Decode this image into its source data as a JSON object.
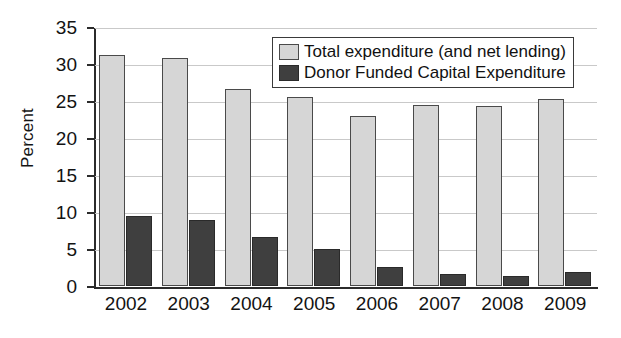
{
  "chart_data": {
    "type": "bar",
    "title": "",
    "xlabel": "",
    "ylabel": "Percent",
    "categories": [
      "2002",
      "2003",
      "2004",
      "2005",
      "2006",
      "2007",
      "2008",
      "2009"
    ],
    "series": [
      {
        "name": "Total expenditure (and net lending)",
        "color": "#d6d6d6",
        "values": [
          31.2,
          30.8,
          26.6,
          25.5,
          23.0,
          24.5,
          24.3,
          25.3
        ]
      },
      {
        "name": "Donor Funded Capital Expenditure",
        "color": "#3f3f3f",
        "values": [
          9.4,
          8.9,
          6.6,
          5.0,
          2.6,
          1.6,
          1.3,
          1.9
        ]
      }
    ],
    "ylim": [
      0,
      35
    ],
    "yticks": [
      0,
      5,
      10,
      15,
      20,
      25,
      30,
      35
    ],
    "ytick_labels": [
      "0",
      "5",
      "10",
      "15",
      "20",
      "25",
      "30",
      "35"
    ],
    "grid": true,
    "legend_position": "top-right"
  },
  "legend": {
    "entries": [
      {
        "label": "Total expenditure (and net lending)"
      },
      {
        "label": "Donor Funded Capital Expenditure"
      }
    ]
  }
}
